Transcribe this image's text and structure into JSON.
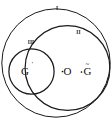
{
  "figure": {
    "background_color": "#ffffff",
    "stroke_color": "#1a1a1a",
    "text_color": "#111111",
    "region_labels": {
      "outer": "I",
      "right": "II",
      "left": "III"
    },
    "point_labels": {
      "left_center": "G",
      "left_center_mark": "'",
      "right_center": "O",
      "right_second": "G",
      "right_second_mark": "~"
    },
    "circles": [
      {
        "name": "outer-circle",
        "label": "I",
        "cx": 56,
        "cy": 63,
        "r": 55
      },
      {
        "name": "right-circle",
        "label": "II",
        "cx": 67,
        "cy": 68,
        "r": 43
      },
      {
        "name": "left-circle",
        "label": "III",
        "cx": 32,
        "cy": 72,
        "r": 23
      }
    ],
    "points": [
      {
        "name": "point-G-prime",
        "label": "G",
        "mark": "'",
        "x": 26,
        "y": 71
      },
      {
        "name": "point-O",
        "label": "O",
        "mark": "",
        "x": 68,
        "y": 71
      },
      {
        "name": "point-G-tilde",
        "label": "G",
        "mark": "~",
        "x": 88,
        "y": 71
      }
    ]
  }
}
